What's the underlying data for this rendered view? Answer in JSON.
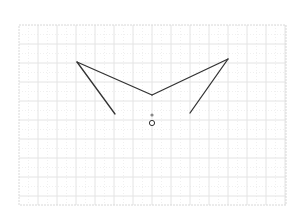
{
  "canvas": {
    "width": 302,
    "height": 220,
    "background": "#ffffff"
  },
  "grid": {
    "x0": 19,
    "y0": 25,
    "x1": 286,
    "y1": 205,
    "major_spacing": 19,
    "minor_spacing": 9.5,
    "major_color": "#e4e4e4",
    "minor_color": "#f0f0f0",
    "border_color": "#d8d8d8"
  },
  "shape": {
    "stroke": "#333333",
    "stroke_width": 1.3,
    "segments": [
      {
        "name": "left-arm-lower",
        "from": [
          115,
          114
        ],
        "to": [
          77,
          62
        ]
      },
      {
        "name": "left-arm-upper",
        "from": [
          77,
          62
        ],
        "to": [
          152,
          95
        ]
      },
      {
        "name": "right-arm-upper",
        "from": [
          152,
          95
        ],
        "to": [
          228,
          59
        ]
      },
      {
        "name": "right-arm-lower",
        "from": [
          228,
          59
        ],
        "to": [
          190,
          113
        ]
      }
    ]
  },
  "markers": {
    "dot": {
      "cx": 152,
      "cy": 115,
      "r": 1.6,
      "fill": "#888888"
    },
    "ring": {
      "cx": 152,
      "cy": 123,
      "r": 2.6,
      "stroke": "#333333",
      "fill": "#ffffff"
    }
  }
}
